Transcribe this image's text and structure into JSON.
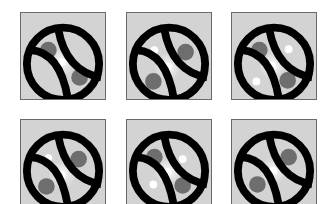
{
  "grid": {
    "tile_size": [
      86,
      88
    ],
    "colors": {
      "background": "#d3d3d3",
      "ring": "#000000",
      "dot_gray": "#6e6e6e",
      "dot_white": "#ffffff",
      "border": "#6a6a6a"
    },
    "tiles": [
      {
        "id": "tile-1",
        "x": 20,
        "y": 12,
        "gray_dots": [
          [
            28,
            38
          ],
          [
            60,
            66
          ]
        ],
        "white_dots": [
          [
            42,
            50
          ]
        ],
        "glow": [
          42,
          50
        ]
      },
      {
        "id": "tile-2",
        "x": 126,
        "y": 12,
        "gray_dots": [
          [
            60,
            40
          ],
          [
            27,
            70
          ]
        ],
        "white_dots": [
          [
            28,
            38
          ],
          [
            42,
            55
          ]
        ],
        "glow": [
          42,
          55
        ]
      },
      {
        "id": "tile-3",
        "x": 231,
        "y": 12,
        "gray_dots": [
          [
            28,
            38
          ],
          [
            57,
            69
          ]
        ],
        "white_dots": [
          [
            58,
            37
          ],
          [
            41,
            54
          ],
          [
            25,
            70
          ]
        ],
        "glow": [
          41,
          54
        ]
      },
      {
        "id": "tile-4",
        "x": 20,
        "y": 119,
        "gray_dots": [
          [
            59,
            40
          ],
          [
            26,
            68
          ]
        ],
        "white_dots": [
          [
            28,
            39
          ],
          [
            42,
            56
          ]
        ],
        "glow": [
          42,
          56
        ]
      },
      {
        "id": "tile-5",
        "x": 126,
        "y": 119,
        "gray_dots": [
          [
            28,
            38
          ],
          [
            57,
            67
          ]
        ],
        "white_dots": [
          [
            57,
            40
          ],
          [
            42,
            53
          ],
          [
            27,
            66
          ]
        ],
        "glow": [
          42,
          53
        ]
      },
      {
        "id": "tile-6",
        "x": 231,
        "y": 119,
        "gray_dots": [
          [
            58,
            38
          ],
          [
            26,
            66
          ]
        ],
        "white_dots": [
          [
            42,
            52
          ]
        ],
        "glow": [
          42,
          52
        ]
      }
    ]
  }
}
